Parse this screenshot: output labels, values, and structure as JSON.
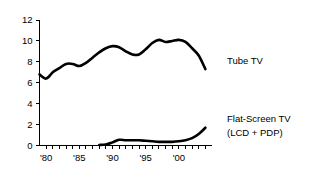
{
  "chart_data": {
    "type": "line",
    "title": "",
    "xlabel": "",
    "ylabel": "",
    "xlim": [
      1979,
      2005
    ],
    "ylim": [
      0,
      12
    ],
    "grid": false,
    "legend_position": "right-inline-labels",
    "y_ticks": [
      0,
      2,
      4,
      6,
      8,
      10,
      12
    ],
    "y_tick_labels": [
      "0",
      "2",
      "4",
      "6",
      "8",
      "10",
      "12"
    ],
    "x_ticks": [
      1980,
      1981,
      1982,
      1983,
      1984,
      1985,
      1986,
      1987,
      1988,
      1989,
      1990,
      1991,
      1992,
      1993,
      1994,
      1995,
      1996,
      1997,
      1998,
      1999,
      2000,
      2001,
      2002,
      2003,
      2004
    ],
    "x_tick_labels": [
      {
        "value": 1980,
        "label": "'80"
      },
      {
        "value": 1985,
        "label": "'85"
      },
      {
        "value": 1990,
        "label": "'90"
      },
      {
        "value": 1995,
        "label": "'95"
      },
      {
        "value": 2000,
        "label": "'00"
      }
    ],
    "series": [
      {
        "name": "Tube TV",
        "label_lines": [
          "Tube TV"
        ],
        "color": "#000000",
        "x": [
          1979,
          1980,
          1981,
          1982,
          1983,
          1984,
          1985,
          1986,
          1987,
          1988,
          1989,
          1990,
          1991,
          1992,
          1993,
          1994,
          1995,
          1996,
          1997,
          1998,
          1999,
          2000,
          2001,
          2002,
          2003,
          2004
        ],
        "values": [
          6.8,
          6.4,
          7.0,
          7.4,
          7.8,
          7.8,
          7.6,
          7.9,
          8.4,
          8.9,
          9.3,
          9.5,
          9.4,
          9.0,
          8.7,
          8.7,
          9.2,
          9.8,
          10.1,
          9.9,
          10.0,
          10.1,
          9.9,
          9.3,
          8.6,
          7.3
        ]
      },
      {
        "name": "Flat-Screen TV (LCD + PDP)",
        "label_lines": [
          "Flat-Screen TV",
          "(LCD + PDP)"
        ],
        "color": "#000000",
        "x": [
          1988,
          1989,
          1990,
          1991,
          1992,
          1993,
          1994,
          1995,
          1996,
          1997,
          1998,
          1999,
          2000,
          2001,
          2002,
          2003,
          2004
        ],
        "values": [
          0.05,
          0.1,
          0.3,
          0.55,
          0.5,
          0.5,
          0.5,
          0.45,
          0.4,
          0.35,
          0.35,
          0.35,
          0.4,
          0.5,
          0.7,
          1.1,
          1.7
        ]
      }
    ]
  },
  "annotations": {
    "tube_label": "Tube TV",
    "flat_label_line1": "Flat-Screen TV",
    "flat_label_line2": "(LCD + PDP)"
  }
}
